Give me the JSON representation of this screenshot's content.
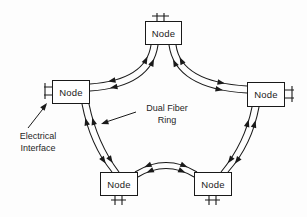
{
  "diagram": {
    "type": "network-ring-topology",
    "nodes": [
      {
        "id": "top",
        "label": "Node"
      },
      {
        "id": "left",
        "label": "Node"
      },
      {
        "id": "right",
        "label": "Node"
      },
      {
        "id": "bottom-left",
        "label": "Node"
      },
      {
        "id": "bottom-right",
        "label": "Node"
      }
    ],
    "annotations": {
      "ring_label": {
        "line1": "Dual Fiber",
        "line2": "Ring"
      },
      "interface_label": {
        "line1": "Electrical",
        "line2": "Interface"
      }
    },
    "colors": {
      "line": "#1a1a1a",
      "background": "#fdfdfd",
      "node_fill": "#ffffff"
    }
  }
}
